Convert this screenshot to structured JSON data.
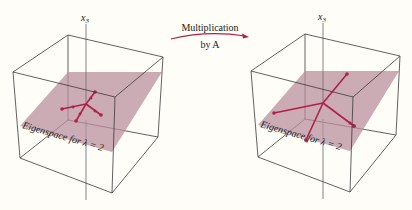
{
  "figure": {
    "arrow_label_line1": "Multiplication",
    "arrow_label_line2": "by A",
    "arrow_color": "#b0214a",
    "plane_color": "#b98f9e",
    "vector_color": "#b0214a"
  },
  "left_panel": {
    "axis_label": "x",
    "axis_subscript": "3",
    "plane_label": "Eigenspace for λ = 2"
  },
  "right_panel": {
    "axis_label": "x",
    "axis_subscript": "3",
    "plane_label": "Eigenspace for λ = 2"
  }
}
